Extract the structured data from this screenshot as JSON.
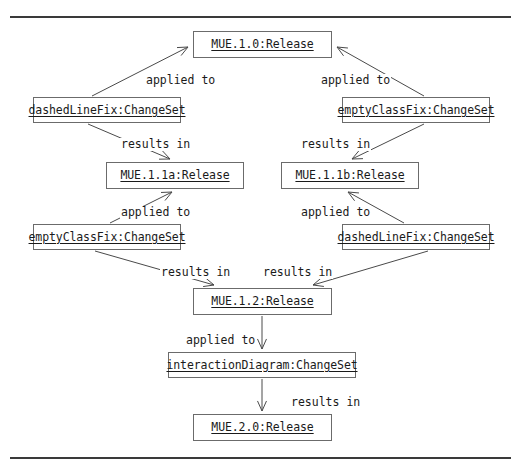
{
  "diagram": {
    "title_hidden": "",
    "figure_rules": {
      "top_rule": "horizontal-rule",
      "bottom_rule": "horizontal-rule"
    },
    "nodes": [
      {
        "id": "mue10",
        "label": "MUE.1.0:Release",
        "kind": "Release",
        "x": 193,
        "y": 31,
        "w": 139,
        "h": 27
      },
      {
        "id": "cs_dlf1",
        "label": "dashedLineFix:ChangeSet",
        "kind": "ChangeSet",
        "x": 33,
        "y": 97,
        "w": 148,
        "h": 26
      },
      {
        "id": "cs_ecf1",
        "label": "emptyClassFix:ChangeSet",
        "kind": "ChangeSet",
        "x": 342,
        "y": 97,
        "w": 148,
        "h": 26
      },
      {
        "id": "mue11a",
        "label": "MUE.1.1a:Release",
        "kind": "Release",
        "x": 106,
        "y": 162,
        "w": 138,
        "h": 27
      },
      {
        "id": "mue11b",
        "label": "MUE.1.1b:Release",
        "kind": "Release",
        "x": 281,
        "y": 162,
        "w": 138,
        "h": 27
      },
      {
        "id": "cs_ecf2",
        "label": "emptyClassFix:ChangeSet",
        "kind": "ChangeSet",
        "x": 33,
        "y": 224,
        "w": 148,
        "h": 26
      },
      {
        "id": "cs_dlf2",
        "label": "dashedLineFix:ChangeSet",
        "kind": "ChangeSet",
        "x": 342,
        "y": 224,
        "w": 148,
        "h": 26
      },
      {
        "id": "mue12",
        "label": "MUE.1.2:Release",
        "kind": "Release",
        "x": 193,
        "y": 288,
        "w": 139,
        "h": 27
      },
      {
        "id": "cs_int",
        "label": "interactionDiagram:ChangeSet",
        "kind": "ChangeSet",
        "x": 168,
        "y": 352,
        "w": 188,
        "h": 26
      },
      {
        "id": "mue20",
        "label": "MUE.2.0:Release",
        "kind": "Release",
        "x": 193,
        "y": 414,
        "w": 139,
        "h": 27
      }
    ],
    "edges": [
      {
        "id": "e1",
        "from": "cs_dlf1",
        "to": "mue10",
        "label": "applied to",
        "label_x": 145,
        "label_y": 74,
        "x1": 92,
        "y1": 96,
        "x2": 188,
        "y2": 47
      },
      {
        "id": "e2",
        "from": "cs_ecf1",
        "to": "mue10",
        "label": "applied to",
        "label_x": 320,
        "label_y": 74,
        "x1": 424,
        "y1": 96,
        "x2": 337,
        "y2": 47
      },
      {
        "id": "e3",
        "from": "cs_dlf1",
        "to": "mue11a",
        "label": "results in",
        "label_x": 120,
        "label_y": 138,
        "x1": 88,
        "y1": 124,
        "x2": 170,
        "y2": 159
      },
      {
        "id": "e4",
        "from": "cs_ecf1",
        "to": "mue11b",
        "label": "results in",
        "label_x": 300,
        "label_y": 138,
        "x1": 424,
        "y1": 124,
        "x2": 352,
        "y2": 159
      },
      {
        "id": "e5",
        "from": "cs_ecf2",
        "to": "mue11a",
        "label": "applied to",
        "label_x": 120,
        "label_y": 206,
        "x1": 110,
        "y1": 223,
        "x2": 172,
        "y2": 192
      },
      {
        "id": "e6",
        "from": "cs_dlf2",
        "to": "mue11b",
        "label": "applied to",
        "label_x": 300,
        "label_y": 206,
        "x1": 404,
        "y1": 223,
        "x2": 348,
        "y2": 192
      },
      {
        "id": "e7",
        "from": "cs_ecf2",
        "to": "mue12",
        "label": "results in",
        "label_x": 160,
        "label_y": 266,
        "x1": 95,
        "y1": 251,
        "x2": 214,
        "y2": 285
      },
      {
        "id": "e8",
        "from": "cs_dlf2",
        "to": "mue12",
        "label": "results in",
        "label_x": 262,
        "label_y": 266,
        "x1": 428,
        "y1": 251,
        "x2": 313,
        "y2": 285
      },
      {
        "id": "e9",
        "from": "mue12",
        "to": "cs_int",
        "label": "applied to",
        "label_x": 185,
        "label_y": 334,
        "x1": 262,
        "y1": 316,
        "x2": 262,
        "y2": 349
      },
      {
        "id": "e10",
        "from": "cs_int",
        "to": "mue20",
        "label": "results in",
        "label_x": 290,
        "label_y": 396,
        "x1": 262,
        "y1": 379,
        "x2": 262,
        "y2": 411
      }
    ],
    "colors": {
      "box_border": "#6b6b6b",
      "text": "#1a1a1a",
      "edge": "#4a4a4a",
      "rule": "#3a3a3a",
      "background": "#ffffff"
    }
  }
}
